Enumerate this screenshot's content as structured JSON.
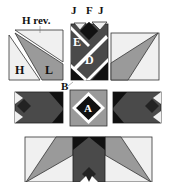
{
  "colors": {
    "background": "#ffffff",
    "light": "#f0f0f0",
    "medium": "#9a9a9a",
    "dark": "#4a4a4a",
    "black": "#111111",
    "outline": "#333333",
    "label_light": "#ffffff",
    "label_dark": "#111111"
  },
  "labels": {
    "h_rev": "H rev.",
    "h": "H",
    "l": "L",
    "j_left": "J",
    "f": "F",
    "j_right": "J",
    "e": "E",
    "d": "D",
    "b": "B",
    "a": "A"
  }
}
